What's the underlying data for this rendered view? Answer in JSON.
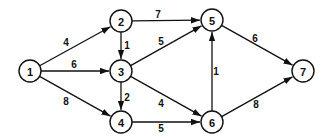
{
  "diagram": {
    "type": "directed-weighted-graph",
    "nodes": [
      {
        "id": "1",
        "label": "1",
        "x": 30,
        "y": 71
      },
      {
        "id": "2",
        "label": "2",
        "x": 121,
        "y": 21
      },
      {
        "id": "3",
        "label": "3",
        "x": 121,
        "y": 71
      },
      {
        "id": "4",
        "label": "4",
        "x": 121,
        "y": 122
      },
      {
        "id": "5",
        "label": "5",
        "x": 212,
        "y": 20
      },
      {
        "id": "6",
        "label": "6",
        "x": 212,
        "y": 122
      },
      {
        "id": "7",
        "label": "7",
        "x": 303,
        "y": 71
      }
    ],
    "edges": [
      {
        "from": "1",
        "to": "2",
        "weight": "4",
        "lx": 66,
        "ly": 42
      },
      {
        "from": "1",
        "to": "3",
        "weight": "6",
        "lx": 74,
        "ly": 64
      },
      {
        "from": "1",
        "to": "4",
        "weight": "8",
        "lx": 66,
        "ly": 101
      },
      {
        "from": "2",
        "to": "3",
        "weight": "1",
        "lx": 127,
        "ly": 45
      },
      {
        "from": "2",
        "to": "5",
        "weight": "7",
        "lx": 158,
        "ly": 14
      },
      {
        "from": "3",
        "to": "4",
        "weight": "2",
        "lx": 127,
        "ly": 97
      },
      {
        "from": "3",
        "to": "5",
        "weight": "5",
        "lx": 161,
        "ly": 41
      },
      {
        "from": "3",
        "to": "6",
        "weight": "4",
        "lx": 161,
        "ly": 103
      },
      {
        "from": "4",
        "to": "6",
        "weight": "5",
        "lx": 161,
        "ly": 128
      },
      {
        "from": "6",
        "to": "5",
        "weight": "1",
        "lx": 216,
        "ly": 71
      },
      {
        "from": "5",
        "to": "7",
        "weight": "6",
        "lx": 255,
        "ly": 38
      },
      {
        "from": "6",
        "to": "7",
        "weight": "8",
        "lx": 256,
        "ly": 104
      }
    ]
  }
}
